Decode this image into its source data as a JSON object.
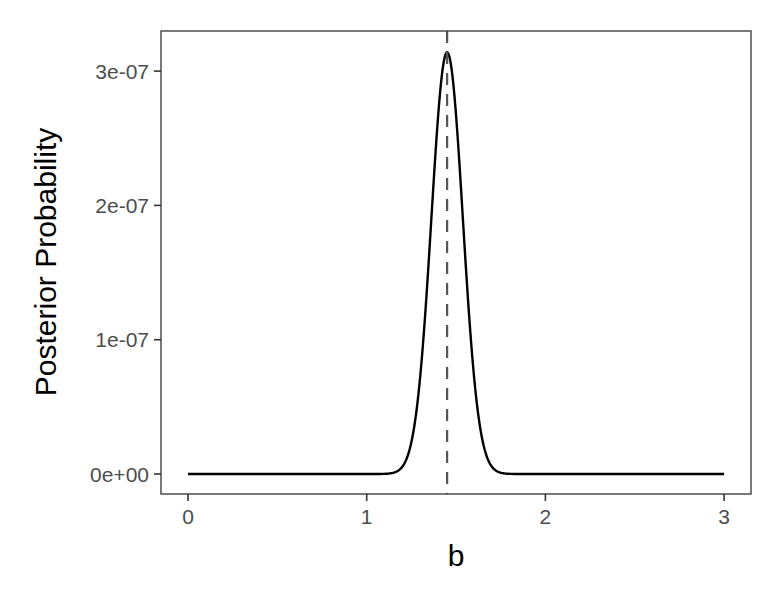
{
  "chart_data": {
    "type": "line",
    "title": "",
    "xlabel": "b",
    "ylabel": "Posterior Probability",
    "xlim": [
      -0.15,
      3.15
    ],
    "ylim": [
      -1.5e-08,
      3.3e-07
    ],
    "x_ticks": [
      0,
      1,
      2,
      3
    ],
    "x_tick_labels": [
      "0",
      "1",
      "2",
      "3"
    ],
    "y_ticks": [
      0,
      1e-07,
      2e-07,
      3e-07
    ],
    "y_tick_labels": [
      "0e+00",
      "1e-07",
      "2e-07",
      "3e-07"
    ],
    "grid": false,
    "legend": null,
    "series": [
      {
        "name": "posterior",
        "style": "solid",
        "color": "#000000",
        "shape": "gaussian",
        "peak_x": 1.45,
        "peak_y": 3.14e-07,
        "sd": 0.088,
        "x_range": [
          0,
          3
        ],
        "x": [
          0,
          1.0,
          1.1,
          1.2,
          1.25,
          1.3,
          1.35,
          1.4,
          1.45,
          1.5,
          1.55,
          1.6,
          1.65,
          1.7,
          1.8,
          1.9,
          3.0
        ],
        "y": [
          0,
          0.0,
          1e-09,
          1.3e-08,
          3.8e-08,
          7.8e-08,
          1.54e-07,
          2.67e-07,
          3.14e-07,
          2.67e-07,
          1.54e-07,
          7.8e-08,
          3.8e-08,
          1.3e-08,
          1e-09,
          0.0,
          0
        ]
      }
    ],
    "annotations": [
      {
        "type": "vline",
        "x": 1.45,
        "style": "dashed",
        "color": "#555555",
        "label": ""
      }
    ]
  },
  "axes": {
    "x_title": "b",
    "y_title": "Posterior Probability",
    "x_tick_labels": [
      "0",
      "1",
      "2",
      "3"
    ],
    "y_tick_labels": [
      "0e+00",
      "1e-07",
      "2e-07",
      "3e-07"
    ]
  },
  "colors": {
    "curve": "#000000",
    "vline": "#555555",
    "panel_border": "#333333",
    "tick_text": "#4d4d4d",
    "background": "#ffffff"
  }
}
